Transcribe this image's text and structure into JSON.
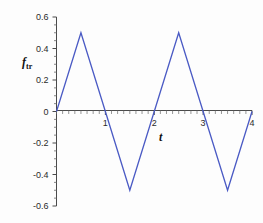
{
  "chart_data": {
    "type": "line",
    "title": "",
    "xlabel": "t",
    "ylabel": "f_tr",
    "ylabel_base": "f",
    "ylabel_sub": "tr",
    "xlim": [
      0,
      4
    ],
    "ylim": [
      -0.6,
      0.6
    ],
    "grid": false,
    "legend": null,
    "line_color": "#4a5ac4",
    "axis_color": "#4a4a4a",
    "xticks": [
      {
        "value": 1,
        "label": "1"
      },
      {
        "value": 2,
        "label": "2"
      },
      {
        "value": 3,
        "label": "3"
      },
      {
        "value": 4,
        "label": "4"
      }
    ],
    "yticks": [
      {
        "value": 0.6,
        "label": "0.6"
      },
      {
        "value": 0.4,
        "label": "0.4"
      },
      {
        "value": 0.2,
        "label": "0.2"
      },
      {
        "value": 0,
        "label": "0"
      },
      {
        "value": -0.2,
        "label": "-0.2"
      },
      {
        "value": -0.4,
        "label": "-0.4"
      },
      {
        "value": -0.6,
        "label": "-0.6"
      }
    ],
    "x_minor_tick_step": 0.125,
    "y_minor_tick_step": 0.05,
    "series": [
      {
        "name": "f_tr",
        "x": [
          0,
          0.5,
          1.5,
          2.5,
          3.5,
          4.0
        ],
        "y": [
          0,
          0.5,
          -0.5,
          0.5,
          -0.5,
          0.0
        ]
      }
    ],
    "vertices": [
      {
        "t": 0,
        "f": 0.0
      },
      {
        "t": 0.5,
        "f": 0.5
      },
      {
        "t": 1.5,
        "f": -0.5
      },
      {
        "t": 2.5,
        "f": 0.5
      },
      {
        "t": 3.5,
        "f": -0.5
      },
      {
        "t": 4.0,
        "f": 0.0
      }
    ]
  }
}
